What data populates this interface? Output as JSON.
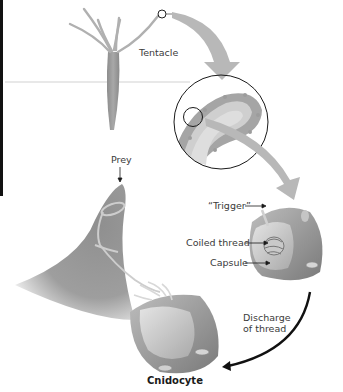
{
  "diagram": {
    "title": "Cnidocyte",
    "labels": {
      "tentacle": "Tentacle",
      "prey": "Prey",
      "trigger": "“Trigger”",
      "coiled_thread": "Coiled thread",
      "capsule": "Capsule",
      "discharge_line1": "Discharge",
      "discharge_line2": "of thread",
      "cnidocyte": "Cnidocyte"
    },
    "colors": {
      "tissue": "#9a9a9a",
      "tissue_light": "#c8c8c8",
      "arrow_gray": "#b5b5b5",
      "outline": "#1a1a1a",
      "text": "#3a3a3a"
    }
  }
}
